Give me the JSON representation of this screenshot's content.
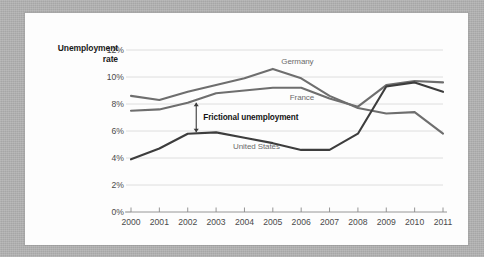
{
  "figure": {
    "background_color": "#b3b3b3",
    "card_color": "#fdfdfd"
  },
  "chart_data": {
    "type": "line",
    "title": "",
    "xlabel": "",
    "ylabel": "Unemployment rate",
    "ylabel_line1": "Unemployment",
    "ylabel_line2": "rate",
    "x": [
      2000,
      2001,
      2002,
      2003,
      2004,
      2005,
      2006,
      2007,
      2008,
      2009,
      2010,
      2011
    ],
    "categories": [
      "2000",
      "2001",
      "2002",
      "2003",
      "2004",
      "2005",
      "2006",
      "2007",
      "2008",
      "2009",
      "2010",
      "2011"
    ],
    "xlim": [
      2000,
      2011
    ],
    "ylim": [
      0,
      12
    ],
    "yticks": [
      0,
      2,
      4,
      6,
      8,
      10,
      12
    ],
    "ytick_labels": [
      "0%",
      "2%",
      "4%",
      "6%",
      "8%",
      "10%",
      "12%"
    ],
    "grid": true,
    "legend_position": "inline-labels",
    "series": [
      {
        "name": "Germany",
        "color": "#6e6e6e",
        "values": [
          8.6,
          8.3,
          8.9,
          9.4,
          9.9,
          10.6,
          9.9,
          8.6,
          7.7,
          7.3,
          7.4,
          5.8
        ],
        "label_x": 2005.3,
        "label_y": 11.1
      },
      {
        "name": "France",
        "color": "#6e6e6e",
        "values": [
          7.5,
          7.6,
          8.1,
          8.8,
          9.0,
          9.2,
          9.2,
          8.4,
          7.8,
          9.4,
          9.7,
          9.6
        ],
        "label_x": 2005.6,
        "label_y": 8.45
      },
      {
        "name": "United States",
        "color": "#3d3d3d",
        "values": [
          3.9,
          4.7,
          5.8,
          5.9,
          5.5,
          5.1,
          4.6,
          4.6,
          5.8,
          9.3,
          9.6,
          8.9
        ],
        "label_x": 2003.6,
        "label_y": 4.8
      }
    ],
    "annotations": [
      {
        "text": "Frictional unemployment",
        "arrow_x": 2002.3,
        "arrow_top": 8.1,
        "arrow_bottom": 5.9,
        "label_x": 2002.55,
        "label_y": 7.0
      }
    ]
  }
}
